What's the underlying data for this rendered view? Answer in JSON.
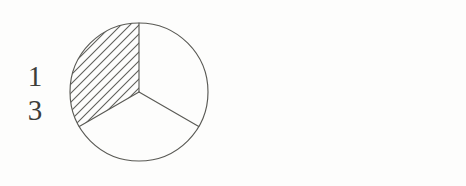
{
  "figure": {
    "background_color": "#fdfdfc",
    "stroke_color": "#5a5a55",
    "hatch_color": "#5e5e58",
    "text_color": "#3d3d3a",
    "width": 466,
    "height": 186,
    "caption": ""
  },
  "items": [
    {
      "id": "one-third",
      "fraction": {
        "numerator": "1",
        "denominator": "3",
        "value_text": "1/3"
      },
      "circle": {
        "center_x": 73,
        "center_y": 74,
        "radius": 69,
        "parts_total": 3,
        "parts_shaded": 1,
        "divider_angles_deg": [
          90,
          210,
          330
        ],
        "shaded_start_deg": 90,
        "shaded_end_deg": 210,
        "hatch_direction": "diagonal-up-right",
        "hatch_spacing_px": 6.5
      }
    },
    {
      "id": "one-fourth",
      "fraction": {
        "numerator": "1",
        "denominator": "4",
        "value_text": "1/4"
      },
      "circle": {
        "center_x": 73,
        "center_y": 74,
        "radius": 70,
        "parts_total": 4,
        "parts_shaded": 1,
        "divider_angles_deg": [
          0,
          90,
          180,
          270
        ],
        "shaded_start_deg": 90,
        "shaded_end_deg": 180,
        "hatch_direction": "diagonal-up-right",
        "hatch_spacing_px": 6.5
      }
    }
  ]
}
